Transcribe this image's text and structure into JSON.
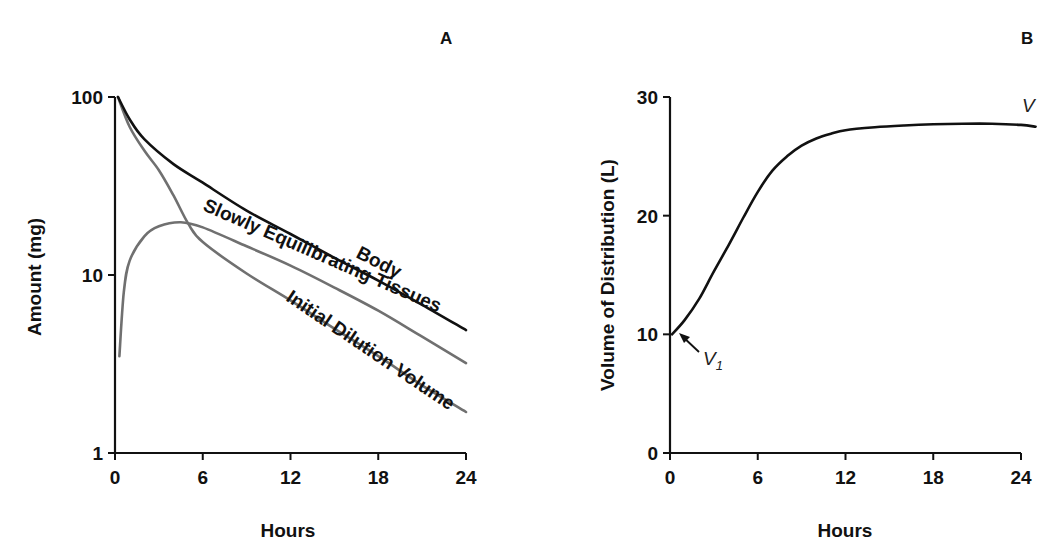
{
  "figure": {
    "panel_a": {
      "letter": "A",
      "xlabel": "Hours",
      "ylabel": "Amount (mg)",
      "x_ticks": [
        "0",
        "6",
        "12",
        "18",
        "24"
      ],
      "y_ticks": [
        "1",
        "10",
        "100"
      ],
      "curve_labels": {
        "body": "Body",
        "slowly": "Slowly Equilibrating Tissues",
        "initial": "Initial Dilution Volume"
      }
    },
    "panel_b": {
      "letter": "B",
      "xlabel": "Hours",
      "ylabel": "Volume of Distribution (L)",
      "x_ticks": [
        "0",
        "6",
        "12",
        "18",
        "24"
      ],
      "y_ticks": [
        "0",
        "10",
        "20",
        "30"
      ],
      "annotations": {
        "v": "V",
        "v1_main": "V",
        "v1_sub": "1"
      }
    },
    "colors": {
      "body_curve": "#111111",
      "tissue_curves": "#707070",
      "axis": "#111111"
    }
  },
  "chart_data": [
    {
      "type": "line",
      "title": "A",
      "xlabel": "Hours",
      "ylabel": "Amount (mg)",
      "yscale": "log",
      "xlim": [
        0,
        24
      ],
      "ylim": [
        1,
        100
      ],
      "x_ticks": [
        0,
        6,
        12,
        18,
        24
      ],
      "y_ticks": [
        1,
        10,
        100
      ],
      "grid": false,
      "legend": "inline labels along curves",
      "series": [
        {
          "name": "Body",
          "color": "#111111",
          "x": [
            0,
            1,
            2,
            4,
            6,
            9,
            12,
            15,
            18,
            21,
            24
          ],
          "values": [
            100,
            75,
            58,
            42,
            33,
            23,
            17,
            12.5,
            9.3,
            6.8,
            4.9
          ]
        },
        {
          "name": "Slowly Equilibrating Tissues",
          "color": "#707070",
          "x": [
            0.3,
            0.6,
            1,
            2,
            3,
            4.5,
            6,
            9,
            12,
            15,
            18,
            21,
            24
          ],
          "values": [
            3.5,
            8,
            12,
            16.5,
            18.8,
            19.8,
            18.5,
            14.5,
            11.3,
            8.5,
            6.3,
            4.5,
            3.2
          ]
        },
        {
          "name": "Initial Dilution Volume",
          "color": "#707070",
          "x": [
            0,
            1,
            2,
            3,
            4,
            5,
            6,
            9,
            12,
            15,
            18,
            21,
            24
          ],
          "values": [
            100,
            68,
            50,
            38.8,
            28,
            19.5,
            15.3,
            10.2,
            7.2,
            5.0,
            3.5,
            2.4,
            1.7
          ]
        }
      ]
    },
    {
      "type": "line",
      "title": "B",
      "xlabel": "Hours",
      "ylabel": "Volume of Distribution (L)",
      "xlim": [
        0,
        24
      ],
      "ylim": [
        0,
        30
      ],
      "x_ticks": [
        0,
        6,
        12,
        18,
        24
      ],
      "y_ticks": [
        0,
        10,
        20,
        30
      ],
      "grid": false,
      "annotations": [
        {
          "text": "V",
          "x": 24,
          "y": 29
        },
        {
          "text": "V1",
          "x": 0,
          "y": 10,
          "arrow": true
        }
      ],
      "series": [
        {
          "name": "V",
          "color": "#111111",
          "x": [
            0,
            1,
            2,
            3,
            4,
            5,
            6,
            7,
            8,
            9,
            10,
            11,
            12,
            14,
            16,
            18,
            20,
            22,
            24,
            25
          ],
          "values": [
            10,
            11.2,
            13,
            15.3,
            17.5,
            19.8,
            22,
            23.8,
            25,
            25.9,
            26.5,
            26.9,
            27.2,
            27.45,
            27.6,
            27.7,
            27.75,
            27.75,
            27.65,
            27.5
          ]
        }
      ]
    }
  ]
}
